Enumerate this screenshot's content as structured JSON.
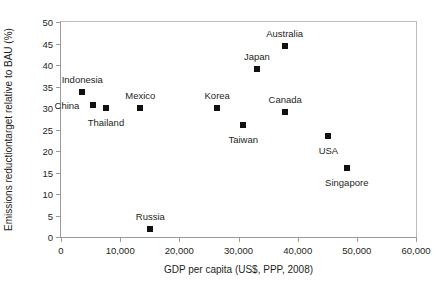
{
  "chart_data": {
    "type": "scatter",
    "title": "",
    "xlabel": "GDP per capita (US$, PPP, 2008)",
    "ylabel": "Emissions reductiontarget relative to BAU (%)",
    "xlim": [
      0,
      60000
    ],
    "ylim": [
      0,
      50
    ],
    "xticks": [
      "0",
      "10,000",
      "20,000",
      "30,000",
      "40,000",
      "50,000",
      "60,000"
    ],
    "xtick_values": [
      0,
      10000,
      20000,
      30000,
      40000,
      50000,
      60000
    ],
    "yticks": [
      "0",
      "5",
      "10",
      "15",
      "20",
      "25",
      "30",
      "35",
      "40",
      "45",
      "50"
    ],
    "ytick_values": [
      0,
      5,
      10,
      15,
      20,
      25,
      30,
      35,
      40,
      45,
      50
    ],
    "grid": false,
    "legend": null,
    "marker_color": "#111111",
    "axis_color": "#9a9a9a",
    "points": [
      {
        "label": "Indonesia",
        "x": 3600,
        "y": 33.7,
        "label_dx": 0,
        "label_dy": -13
      },
      {
        "label": "China",
        "x": 5400,
        "y": 30.8,
        "label_dx": -26,
        "label_dy": 0
      },
      {
        "label": "Thailand",
        "x": 7600,
        "y": 30.0,
        "label_dx": 0,
        "label_dy": 14
      },
      {
        "label": "Mexico",
        "x": 13400,
        "y": 30.0,
        "label_dx": 0,
        "label_dy": -13
      },
      {
        "label": "Russia",
        "x": 15100,
        "y": 1.8,
        "label_dx": 0,
        "label_dy": -13
      },
      {
        "label": "Korea",
        "x": 26400,
        "y": 30.0,
        "label_dx": 0,
        "label_dy": -13
      },
      {
        "label": "Taiwan",
        "x": 30800,
        "y": 26.0,
        "label_dx": 0,
        "label_dy": 14
      },
      {
        "label": "Japan",
        "x": 33100,
        "y": 39.0,
        "label_dx": 0,
        "label_dy": -13
      },
      {
        "label": "Australia",
        "x": 37800,
        "y": 44.5,
        "label_dx": 0,
        "label_dy": -13
      },
      {
        "label": "Canada",
        "x": 37900,
        "y": 29.0,
        "label_dx": 0,
        "label_dy": -13
      },
      {
        "label": "USA",
        "x": 45200,
        "y": 23.5,
        "label_dx": 0,
        "label_dy": 14
      },
      {
        "label": "Singapore",
        "x": 48300,
        "y": 16.0,
        "label_dx": 0,
        "label_dy": 14
      }
    ]
  }
}
